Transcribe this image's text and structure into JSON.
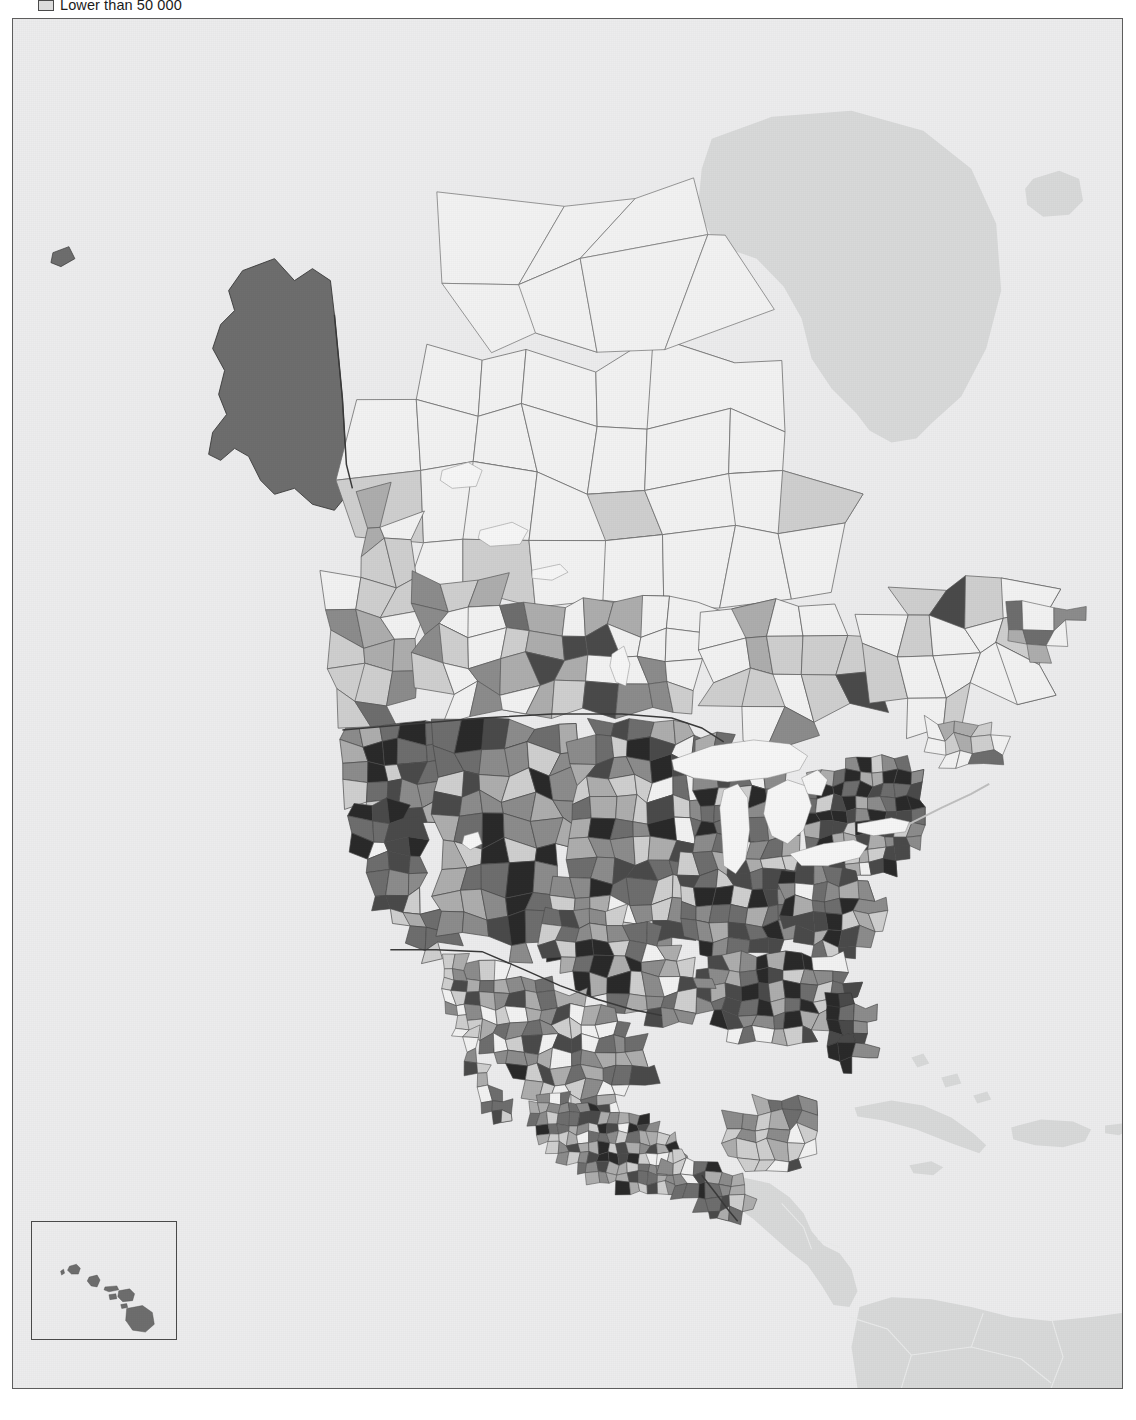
{
  "figure": {
    "kind": "choropleth-map",
    "region": "North America",
    "background_color": "#ececed",
    "frame_color": "#5d5d5d"
  },
  "legend": {
    "visible_entries": [
      {
        "label": "Lower than 50 000",
        "swatch_color": "#dcdcdc",
        "swatch_border": "#4a4a4a"
      }
    ],
    "note_clipped_at_top": true
  },
  "classes": {
    "lightest": "#f2f2f2",
    "light": "#cfcfcf",
    "medium_light": "#adadad",
    "medium": "#8c8c8c",
    "medium_dark": "#6e6e6e",
    "dark": "#4a4a4a",
    "darkest": "#2a2a2a",
    "out_of_area_land": "#d8d9d9",
    "water": "#f6f6f6",
    "ocean": "#ececed",
    "boundary_line": "#4a4a4a",
    "thin_boundary_line": "#6f6f6f"
  },
  "inset": {
    "name": "Hawaii",
    "border_color": "#4a4a4a",
    "background_color": "#ececed",
    "island_fill": "#6e6e6e"
  },
  "chart_data": {
    "type": "map",
    "map_type": "choropleth",
    "title": "",
    "projection": "lambert-conformal-conic",
    "unit_level": "county / municipality / census division",
    "legend_entries_visible": [
      "Lower than 50 000"
    ],
    "color_scale": [
      "#f2f2f2",
      "#cfcfcf",
      "#adadad",
      "#8c8c8c",
      "#6e6e6e",
      "#4a4a4a",
      "#2a2a2a"
    ],
    "regions": [
      {
        "name": "Alaska",
        "class": "medium_dark",
        "fill": "#6e6e6e"
      },
      {
        "name": "Aleutian Islands",
        "class": "medium_dark",
        "fill": "#6e6e6e"
      },
      {
        "name": "Hawaii",
        "class": "medium_dark",
        "fill": "#6e6e6e"
      },
      {
        "name": "Northern Canada (Yukon, NWT, Nunavut)",
        "class": "lightest",
        "fill": "#f2f2f2"
      },
      {
        "name": "Canadian Arctic Archipelago",
        "class": "lightest",
        "fill": "#f2f2f2"
      },
      {
        "name": "Southern British Columbia",
        "class": "mixed light to medium",
        "fill": "#adadad"
      },
      {
        "name": "Prairie provinces",
        "class": "mixed lightest to medium",
        "fill": "#cfcfcf"
      },
      {
        "name": "Southern Ontario / Quebec corridor",
        "class": "mixed light to dark",
        "fill": "#8c8c8c"
      },
      {
        "name": "Labrador / Newfoundland",
        "class": "lightest to medium",
        "fill": "#cfcfcf"
      },
      {
        "name": "US Pacific Coast (California, Oregon, Washington)",
        "class": "darkest",
        "fill": "#2a2a2a"
      },
      {
        "name": "US Mountain West",
        "class": "medium to dark",
        "fill": "#6e6e6e"
      },
      {
        "name": "US Great Plains",
        "class": "medium_light to medium",
        "fill": "#adadad"
      },
      {
        "name": "US Midwest",
        "class": "medium to darkest",
        "fill": "#4a4a4a"
      },
      {
        "name": "US Northeast / New England",
        "class": "darkest",
        "fill": "#2a2a2a"
      },
      {
        "name": "US Southeast",
        "class": "medium to darkest",
        "fill": "#4a4a4a"
      },
      {
        "name": "Florida",
        "class": "darkest",
        "fill": "#2a2a2a"
      },
      {
        "name": "Texas",
        "class": "medium to darkest",
        "fill": "#4a4a4a"
      },
      {
        "name": "Northern Mexico",
        "class": "light to medium",
        "fill": "#adadad"
      },
      {
        "name": "Central Mexico",
        "class": "medium to darkest",
        "fill": "#6e6e6e"
      },
      {
        "name": "Yucatan Peninsula",
        "class": "medium_light",
        "fill": "#adadad"
      },
      {
        "name": "Greenland",
        "class": "out_of_area_land",
        "fill": "#d8d9d9"
      },
      {
        "name": "Iceland",
        "class": "out_of_area_land",
        "fill": "#d8d9d9"
      },
      {
        "name": "Cuba",
        "class": "out_of_area_land",
        "fill": "#d8d9d9"
      },
      {
        "name": "Hispaniola",
        "class": "out_of_area_land",
        "fill": "#d8d9d9"
      },
      {
        "name": "Jamaica",
        "class": "out_of_area_land",
        "fill": "#d8d9d9"
      },
      {
        "name": "Puerto Rico",
        "class": "out_of_area_land",
        "fill": "#d8d9d9"
      },
      {
        "name": "Bahamas",
        "class": "out_of_area_land",
        "fill": "#d8d9d9"
      },
      {
        "name": "Central America (Guatemala, Belize, Honduras, Nicaragua)",
        "class": "out_of_area_land",
        "fill": "#d8d9d9"
      },
      {
        "name": "Northern South America (Colombia, Venezuela)",
        "class": "out_of_area_land",
        "fill": "#d8d9d9"
      },
      {
        "name": "Great Lakes",
        "class": "water",
        "fill": "#f6f6f6"
      },
      {
        "name": "Hudson Bay",
        "class": "ocean",
        "fill": "#ececed"
      },
      {
        "name": "Gulf of Mexico",
        "class": "ocean",
        "fill": "#ececed"
      }
    ]
  }
}
